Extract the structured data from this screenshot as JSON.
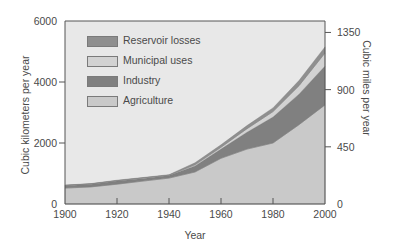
{
  "chart_data": {
    "type": "area",
    "stacked": true,
    "title": "",
    "xlabel": "Year",
    "ylabel": "Cubic kilometers per year",
    "ylabel_right": "Cubic miles per year",
    "x": [
      1900,
      1910,
      1920,
      1930,
      1940,
      1950,
      1960,
      1970,
      1980,
      1990,
      2000
    ],
    "xlim": [
      1900,
      2000
    ],
    "ylim": [
      0,
      6000
    ],
    "ylim_right": [
      0,
      1440
    ],
    "x_ticks": [
      "1900",
      "1920",
      "1940",
      "1960",
      "1980",
      "2000"
    ],
    "y_ticks": [
      "0",
      "2000",
      "4000",
      "6000"
    ],
    "y_ticks_right": [
      "0",
      "450",
      "900",
      "1350"
    ],
    "grid": false,
    "legend_position": "upper-left",
    "series": [
      {
        "name": "Agriculture",
        "color": "#c9c9c9",
        "values": [
          520,
          560,
          650,
          750,
          850,
          1050,
          1500,
          1800,
          2000,
          2600,
          3250
        ]
      },
      {
        "name": "Industry",
        "color": "#808080",
        "values": [
          80,
          90,
          100,
          90,
          80,
          200,
          300,
          550,
          850,
          1000,
          1270
        ]
      },
      {
        "name": "Municipal uses",
        "color": "#d2d2d2",
        "values": [
          10,
          10,
          15,
          15,
          15,
          40,
          60,
          120,
          180,
          280,
          430
        ]
      },
      {
        "name": "Reservoir losses",
        "color": "#8f8f8f",
        "values": [
          10,
          10,
          15,
          15,
          15,
          60,
          80,
          100,
          120,
          170,
          200
        ]
      }
    ],
    "totals": [
      620,
      670,
      780,
      870,
      960,
      1350,
      1940,
      2570,
      3150,
      4050,
      5150
    ]
  },
  "legend": {
    "items": [
      {
        "label": "Reservoir losses",
        "color": "#8f8f8f"
      },
      {
        "label": "Municipal uses",
        "color": "#d2d2d2"
      },
      {
        "label": "Industry",
        "color": "#808080"
      },
      {
        "label": "Agriculture",
        "color": "#c9c9c9"
      }
    ]
  },
  "axes": {
    "x_label": "Year",
    "y_left_label": "Cubic kilometers per year",
    "y_right_label": "Cubic miles per year"
  },
  "colors": {
    "plot_background": "#e8e8e8",
    "axis": "#555555"
  }
}
